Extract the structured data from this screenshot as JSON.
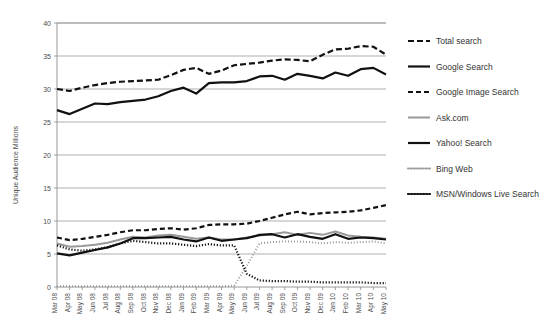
{
  "chart_data": {
    "type": "line",
    "title": "",
    "xlabel": "",
    "ylabel": "Unique Audience Millions",
    "ylim": [
      0,
      40
    ],
    "yticks": [
      0,
      5,
      10,
      15,
      20,
      25,
      30,
      35,
      40
    ],
    "grid": true,
    "legend_position": "right",
    "categories": [
      "Mar 08",
      "Apr 08",
      "May 08",
      "Jun 08",
      "Jul 08",
      "Aug 08",
      "Sep 08",
      "Oct 08",
      "Nov 08",
      "Dec 08",
      "Jan 09",
      "Feb 09",
      "Mar 09",
      "Apr 09",
      "May 09",
      "Jun 09",
      "Jul 09",
      "Aug 09",
      "Sep 09",
      "Oct 09",
      "Nov 09",
      "Dec 09",
      "Jan 10",
      "Feb 10",
      "Mar 10",
      "Apr 10",
      "May 10"
    ],
    "series": [
      {
        "name": "Total search",
        "style": "dashed",
        "color": "#111111",
        "width": 2.2,
        "dash": "6,3",
        "values": [
          30.0,
          29.7,
          30.2,
          30.6,
          30.9,
          31.1,
          31.2,
          31.3,
          31.4,
          32.1,
          32.9,
          33.2,
          32.3,
          32.8,
          33.6,
          33.8,
          34.0,
          34.3,
          34.5,
          34.4,
          34.2,
          35.2,
          36.0,
          36.1,
          36.5,
          36.4,
          35.2
        ]
      },
      {
        "name": "Google Search",
        "style": "solid",
        "color": "#111111",
        "width": 2.2,
        "dash": "",
        "values": [
          26.8,
          26.2,
          27.0,
          27.8,
          27.7,
          28.0,
          28.2,
          28.4,
          28.9,
          29.7,
          30.2,
          29.3,
          30.9,
          31.0,
          31.0,
          31.2,
          31.9,
          32.0,
          31.4,
          32.3,
          32.0,
          31.6,
          32.5,
          32.0,
          33.0,
          33.2,
          32.2
        ]
      },
      {
        "name": "Google Image Search",
        "style": "dashed",
        "color": "#111111",
        "width": 2.2,
        "dash": "5,3",
        "values": [
          7.5,
          7.1,
          7.3,
          7.6,
          7.9,
          8.3,
          8.6,
          8.6,
          8.8,
          8.9,
          8.7,
          8.9,
          9.4,
          9.5,
          9.5,
          9.6,
          10.0,
          10.5,
          11.0,
          11.4,
          11.0,
          11.2,
          11.3,
          11.4,
          11.6,
          12.0,
          12.4
        ]
      },
      {
        "name": "Ask.com",
        "style": "solid",
        "color": "#999999",
        "width": 2.0,
        "dash": "",
        "values": [
          6.6,
          6.1,
          6.2,
          6.4,
          6.7,
          7.2,
          7.6,
          7.5,
          7.8,
          7.9,
          7.6,
          7.3,
          7.5,
          7.2,
          7.2,
          7.5,
          7.8,
          8.0,
          8.3,
          7.9,
          8.2,
          7.9,
          8.4,
          7.8,
          7.6,
          7.5,
          7.3
        ]
      },
      {
        "name": "Yahoo! Search",
        "style": "solid",
        "color": "#111111",
        "width": 2.2,
        "dash": "",
        "values": [
          5.1,
          4.8,
          5.2,
          5.6,
          6.0,
          6.6,
          7.4,
          7.4,
          7.5,
          7.6,
          7.2,
          6.9,
          7.5,
          7.0,
          7.2,
          7.4,
          7.9,
          8.0,
          7.5,
          8.0,
          7.6,
          7.3,
          8.0,
          7.3,
          7.5,
          7.4,
          7.2
        ]
      },
      {
        "name": "Bing Web",
        "style": "dotted",
        "color": "#999999",
        "width": 2.0,
        "dash": "1,2",
        "values": [
          0.1,
          0.1,
          0.1,
          0.1,
          0.1,
          0.1,
          0.1,
          0.1,
          0.1,
          0.1,
          0.1,
          0.1,
          0.1,
          0.1,
          0.2,
          3.2,
          6.6,
          6.8,
          6.9,
          6.9,
          6.8,
          6.6,
          6.8,
          6.7,
          6.8,
          6.9,
          6.6
        ]
      },
      {
        "name": "MSN/Windows Live Search",
        "style": "dotted",
        "color": "#111111",
        "width": 2.2,
        "dash": "1.2,1.8",
        "values": [
          6.3,
          5.7,
          5.5,
          5.7,
          6.0,
          6.6,
          7.0,
          6.8,
          6.6,
          6.6,
          6.4,
          6.2,
          6.5,
          6.3,
          6.3,
          2.0,
          1.0,
          0.9,
          0.9,
          0.8,
          0.8,
          0.7,
          0.7,
          0.7,
          0.7,
          0.6,
          0.6
        ]
      }
    ]
  },
  "legend": {
    "entries": [
      {
        "label": "Total search"
      },
      {
        "label": "Google Search"
      },
      {
        "label": "Google Image Search"
      },
      {
        "label": "Ask.com"
      },
      {
        "label": "Yahoo! Search"
      },
      {
        "label": "Bing Web"
      },
      {
        "label": "MSN/Windows Live Search"
      }
    ]
  }
}
